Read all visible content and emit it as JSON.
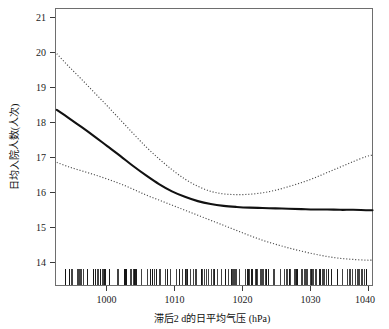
{
  "chart_data": {
    "type": "line",
    "title": "",
    "subtitle": "",
    "xlabel": "滞后2 d的日平均气压 (hPa)",
    "ylabel": "日均入院人数(人次)",
    "xlim": [
      992,
      1041
    ],
    "ylim": [
      13.7,
      21.35
    ],
    "xticks": [
      1000,
      1010,
      1020,
      1030,
      1040
    ],
    "xtick_labels": [
      "1000",
      "1010",
      "1020",
      "1030",
      "1040"
    ],
    "yticks": [
      14,
      15,
      16,
      17,
      18,
      19,
      20,
      21
    ],
    "ytick_labels": [
      "14",
      "15",
      "16",
      "17",
      "18",
      "19",
      "20",
      "21"
    ],
    "grid": false,
    "legend": "none",
    "x": [
      992.2,
      994,
      996,
      998,
      1000,
      1002,
      1004,
      1006,
      1008,
      1010,
      1012,
      1014,
      1016,
      1018,
      1020,
      1022,
      1024,
      1026,
      1028,
      1030,
      1032,
      1034,
      1036,
      1038,
      1040,
      1041
    ],
    "series": [
      {
        "name": "fit",
        "style": "solid",
        "color": "#111111",
        "values": [
          18.55,
          18.33,
          18.08,
          17.82,
          17.55,
          17.28,
          17.0,
          16.74,
          16.5,
          16.3,
          16.15,
          16.03,
          15.95,
          15.9,
          15.87,
          15.85,
          15.84,
          15.83,
          15.82,
          15.81,
          15.8,
          15.8,
          15.79,
          15.79,
          15.78,
          15.78
        ]
      },
      {
        "name": "upper-confidence-band",
        "style": "dotted",
        "color": "#4a4a4a",
        "values": [
          20.1,
          19.76,
          19.4,
          19.03,
          18.66,
          18.28,
          17.9,
          17.53,
          17.2,
          16.9,
          16.64,
          16.44,
          16.3,
          16.23,
          16.21,
          16.22,
          16.26,
          16.33,
          16.43,
          16.54,
          16.67,
          16.82,
          16.97,
          17.12,
          17.26,
          17.3
        ]
      },
      {
        "name": "lower-confidence-band",
        "style": "dotted",
        "color": "#4a4a4a",
        "values": [
          17.1,
          16.98,
          16.87,
          16.76,
          16.64,
          16.51,
          16.36,
          16.2,
          16.06,
          15.92,
          15.78,
          15.64,
          15.5,
          15.36,
          15.22,
          15.08,
          14.95,
          14.84,
          14.74,
          14.65,
          14.57,
          14.5,
          14.45,
          14.42,
          14.4,
          14.4
        ]
      }
    ],
    "rug": {
      "name": "data-rug-marks",
      "axis": "x",
      "description": "dense vertical tick marks along bottom showing observation density",
      "count": 260
    }
  }
}
